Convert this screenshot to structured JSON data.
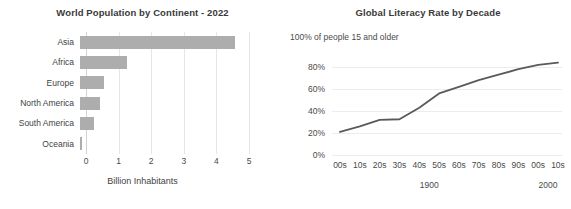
{
  "chart_data": [
    {
      "type": "bar",
      "orientation": "horizontal",
      "title": "World Population by Continent - 2022",
      "xlabel": "Billion Inhabitants",
      "ylabel": "",
      "categories": [
        "Asia",
        "Africa",
        "Europe",
        "North America",
        "South America",
        "Oceania"
      ],
      "values": [
        4.75,
        1.45,
        0.75,
        0.6,
        0.44,
        0.045
      ],
      "xlim": [
        0,
        5
      ],
      "xticks": [
        0,
        1,
        2,
        3,
        4,
        5
      ],
      "xtick_labels": [
        "0",
        "1",
        "2",
        "3",
        "4",
        "5"
      ],
      "grid": "vertical",
      "legend": "none",
      "bar_color": "#adadad"
    },
    {
      "type": "line",
      "title": "Global Literacy Rate by Decade",
      "ylabel": "100% of people 15 and older",
      "xlabel": "",
      "categories": [
        "00s",
        "10s",
        "20s",
        "30s",
        "40s",
        "50s",
        "60s",
        "70s",
        "80s",
        "90s",
        "00s",
        "10s"
      ],
      "era_labels": [
        "1900",
        "2000"
      ],
      "values": [
        21,
        26,
        32,
        32.5,
        43,
        56,
        62,
        68,
        73,
        78,
        82,
        84
      ],
      "ylim": [
        0,
        100
      ],
      "yticks": [
        0,
        20,
        40,
        60,
        80,
        100
      ],
      "ytick_labels": [
        "0%",
        "20%",
        "40%",
        "60%",
        "80%",
        "100%"
      ],
      "grid": "horizontal",
      "legend": "none",
      "line_color": "#5a5a5a"
    }
  ],
  "bar_chart": {
    "title": "World Population by Continent - 2022",
    "xlabel": "Billion Inhabitants",
    "xtick_labels": [
      "0",
      "1",
      "2",
      "3",
      "4",
      "5"
    ],
    "categories": [
      {
        "label": "Asia",
        "value": 4.75
      },
      {
        "label": "Africa",
        "value": 1.45
      },
      {
        "label": "Europe",
        "value": 0.75
      },
      {
        "label": "North America",
        "value": 0.6
      },
      {
        "label": "South America",
        "value": 0.44
      },
      {
        "label": "Oceania",
        "value": 0.045
      }
    ]
  },
  "line_chart": {
    "title": "Global Literacy Rate by Decade",
    "top_axis_label": "100% of people 15 and older",
    "ytick_labels": [
      "80%",
      "60%",
      "40%",
      "20%",
      "0%"
    ],
    "xtick_labels": [
      "00s",
      "10s",
      "20s",
      "30s",
      "40s",
      "50s",
      "60s",
      "70s",
      "80s",
      "90s",
      "00s",
      "10s"
    ],
    "era_labels": [
      "1900",
      "2000"
    ]
  }
}
